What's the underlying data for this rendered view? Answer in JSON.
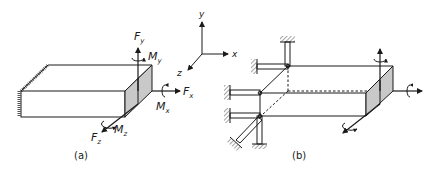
{
  "figure": {
    "panel_a": {
      "caption": "(a)",
      "labels": {
        "fy": "F",
        "fy_sub": "y",
        "my": "M",
        "my_sub": "y",
        "fx": "F",
        "fx_sub": "x",
        "mx": "M",
        "mx_sub": "x",
        "fz": "F",
        "fz_sub": "z",
        "mz": "M",
        "mz_sub": "z"
      }
    },
    "axes": {
      "x": "x",
      "y": "y",
      "z": "z"
    },
    "panel_b": {
      "caption": "(b)"
    },
    "colors": {
      "line": "#1a1a1a",
      "shade": "#c9c9c9",
      "background": "#ffffff"
    }
  }
}
